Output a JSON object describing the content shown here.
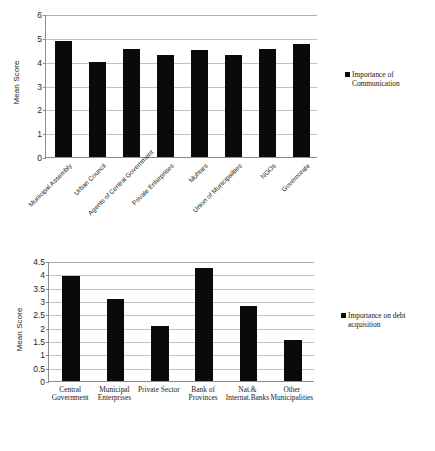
{
  "page": {
    "background": "#ffffff",
    "bar_color": "#0a0a0a",
    "grid_color": "#c2c2c2",
    "axis_color": "#8c8c8c"
  },
  "chart_data": [
    {
      "id": "communication",
      "type": "bar",
      "title": "",
      "xlabel": "",
      "ylabel": "Mean Score",
      "ylim": [
        0,
        6
      ],
      "ytick_step": 1,
      "yticks": [
        "0",
        "1",
        "2",
        "3",
        "4",
        "5",
        "6"
      ],
      "grid": true,
      "legend_position": "right",
      "legend": [
        "Importance of\nCommunication"
      ],
      "series_name": "Importance of Communication",
      "categories": [
        "Municipal Assembly",
        "Urban Council",
        "Agents of Central Government",
        "Private Enterprises",
        "Muhtars",
        "Union of Municipalities",
        "NGOs",
        "Governorate"
      ],
      "values": [
        4.85,
        4.0,
        4.52,
        4.3,
        4.5,
        4.28,
        4.54,
        4.74
      ]
    },
    {
      "id": "debt-acquisition",
      "type": "bar",
      "title": "",
      "xlabel": "",
      "ylabel": "Mean Score",
      "ylim": [
        0,
        4.5
      ],
      "ytick_step": 0.5,
      "yticks": [
        "0",
        "0.5",
        "1",
        "1.5",
        "2",
        "2.5",
        "3",
        "3.5",
        "4",
        "4.5"
      ],
      "grid": true,
      "legend_position": "right",
      "legend": [
        "Importance on debt\nacquisition"
      ],
      "series_name": "Importance on debt acquisition",
      "categories": [
        "Central\nGovernment",
        "Municipal\nEnterprises",
        "Private Sector",
        "Bank of\nProvinces",
        "Nat.&\nInternat.Banks",
        "Other\nMunicipalities"
      ],
      "values": [
        3.92,
        3.08,
        2.06,
        4.22,
        2.83,
        1.53
      ]
    }
  ]
}
